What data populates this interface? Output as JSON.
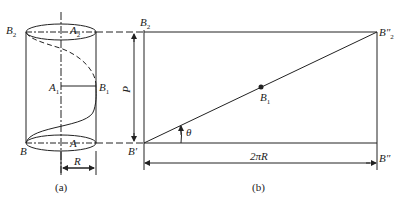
{
  "diagram": {
    "panel_a": {
      "caption": "(a)",
      "labels": {
        "B2": {
          "base": "B",
          "sub": "2"
        },
        "A2": {
          "base": "A",
          "sub": "2"
        },
        "A1": {
          "base": "A",
          "sub": "1"
        },
        "B1": {
          "base": "B",
          "sub": "1"
        },
        "B": {
          "base": "B",
          "sub": ""
        },
        "A": {
          "base": "A",
          "sub": ""
        },
        "R": "R"
      }
    },
    "panel_b": {
      "caption": "(b)",
      "labels": {
        "B2": {
          "base": "B",
          "sub": "2"
        },
        "P": "P",
        "B_prime": "B′",
        "theta": "θ",
        "B1": {
          "base": "B",
          "sub": "1"
        },
        "B2_dprime": {
          "base": "B″",
          "sub": "2"
        },
        "B_dprime": "B″",
        "width": "2πR"
      }
    },
    "colors": {
      "line": "#222222",
      "background": "#ffffff"
    }
  }
}
